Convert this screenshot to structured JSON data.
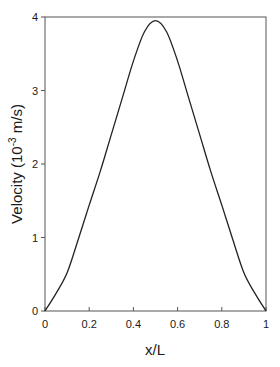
{
  "chart_data": {
    "type": "line",
    "title": "",
    "xlabel": "x/L",
    "ylabel": "Velocity (10-3 m/s)",
    "ylabel_parts": {
      "main": "Velocity (10",
      "sup": "-3",
      "unit": " m/s)"
    },
    "xlim": [
      0,
      1
    ],
    "ylim": [
      0,
      4
    ],
    "x_ticks": [
      "0",
      "0.2",
      "0.4",
      "0.6",
      "0.8",
      "1"
    ],
    "x_tick_values": [
      0,
      0.2,
      0.4,
      0.6,
      0.8,
      1
    ],
    "y_ticks": [
      "0",
      "1",
      "2",
      "3",
      "4"
    ],
    "y_tick_values": [
      0,
      1,
      2,
      3,
      4
    ],
    "grid": false,
    "legend": null,
    "series": [
      {
        "name": "Velocity",
        "color": "#222222",
        "x": [
          0,
          0.05,
          0.1,
          0.15,
          0.2,
          0.25,
          0.3,
          0.35,
          0.4,
          0.45,
          0.5,
          0.55,
          0.6,
          0.65,
          0.7,
          0.75,
          0.8,
          0.85,
          0.9,
          0.95,
          1
        ],
        "values": [
          0,
          0.24,
          0.52,
          0.97,
          1.44,
          1.9,
          2.4,
          2.9,
          3.4,
          3.8,
          3.95,
          3.8,
          3.4,
          2.9,
          2.4,
          1.9,
          1.44,
          0.97,
          0.52,
          0.24,
          0
        ]
      }
    ]
  }
}
